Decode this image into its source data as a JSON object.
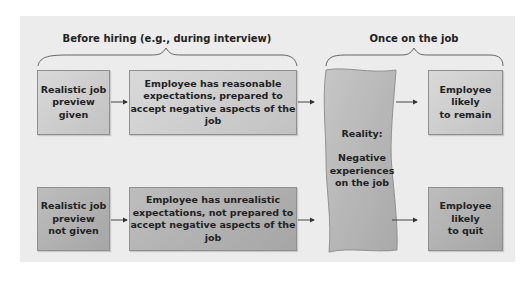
{
  "phases": {
    "before": {
      "label": "Before hiring (e.g., during interview)"
    },
    "after": {
      "label": "Once on the job"
    }
  },
  "rows": [
    {
      "preview": "Realistic job\npreview given",
      "expectation": "Employee has reasonable\nexpectations, prepared to\naccept negative aspects of the job",
      "outcome": "Employee\nlikely\nto remain"
    },
    {
      "preview": "Realistic job\npreview\nnot given",
      "expectation": "Employee has unrealistic\nexpectations, not prepared to\naccept negative aspects of the job",
      "outcome": "Employee\nlikely\nto quit"
    }
  ],
  "reality": {
    "title": "Reality:",
    "body": "Negative\nexperiences\non the job"
  },
  "colors": {
    "panel": "#ececec",
    "box_light": "#cdcdcd",
    "box_dark": "#b0b0b0",
    "reality": "#b8b8b8",
    "text": "#222222"
  }
}
